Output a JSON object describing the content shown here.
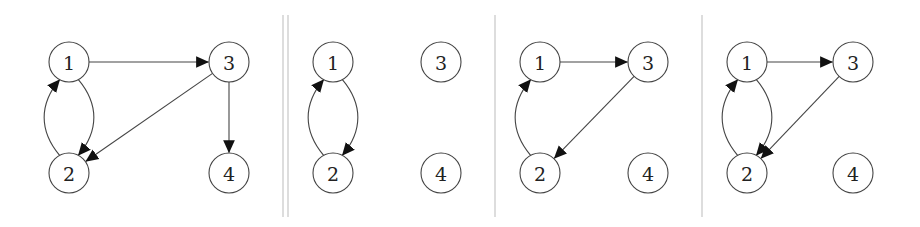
{
  "diagram": {
    "node_radius": 20,
    "colors": {
      "stroke": "#444444",
      "label": "#222222",
      "arrowhead": "#111111",
      "divider": "#bbbbbb"
    },
    "dividers": [
      {
        "type": "double",
        "x": [
          283,
          288
        ],
        "y1": 15,
        "y2": 217
      },
      {
        "type": "single",
        "x": [
          495
        ],
        "y1": 15,
        "y2": 217
      },
      {
        "type": "single",
        "x": [
          702
        ],
        "y1": 15,
        "y2": 217
      }
    ],
    "panels": [
      {
        "id": "panel-1",
        "nodes": [
          {
            "label": "1",
            "x": 69,
            "y": 62
          },
          {
            "label": "2",
            "x": 69,
            "y": 173
          },
          {
            "label": "3",
            "x": 229,
            "y": 62
          },
          {
            "label": "4",
            "x": 229,
            "y": 173
          }
        ],
        "edges": [
          {
            "from": "1",
            "to": "3",
            "shape": "straight"
          },
          {
            "from": "3",
            "to": "4",
            "shape": "straight"
          },
          {
            "from": "3",
            "to": "2",
            "shape": "straight"
          },
          {
            "from": "1",
            "to": "2",
            "shape": "curve-right"
          },
          {
            "from": "2",
            "to": "1",
            "shape": "curve-left"
          }
        ]
      },
      {
        "id": "panel-2",
        "nodes": [
          {
            "label": "1",
            "x": 333,
            "y": 62
          },
          {
            "label": "2",
            "x": 333,
            "y": 173
          },
          {
            "label": "3",
            "x": 441,
            "y": 62
          },
          {
            "label": "4",
            "x": 441,
            "y": 173
          }
        ],
        "edges": [
          {
            "from": "1",
            "to": "2",
            "shape": "curve-right"
          },
          {
            "from": "2",
            "to": "1",
            "shape": "curve-left"
          }
        ]
      },
      {
        "id": "panel-3",
        "nodes": [
          {
            "label": "1",
            "x": 540,
            "y": 62
          },
          {
            "label": "2",
            "x": 540,
            "y": 173
          },
          {
            "label": "3",
            "x": 648,
            "y": 62
          },
          {
            "label": "4",
            "x": 648,
            "y": 173
          }
        ],
        "edges": [
          {
            "from": "1",
            "to": "3",
            "shape": "straight"
          },
          {
            "from": "3",
            "to": "2",
            "shape": "straight"
          },
          {
            "from": "2",
            "to": "1",
            "shape": "curve-left"
          }
        ]
      },
      {
        "id": "panel-4",
        "nodes": [
          {
            "label": "1",
            "x": 747,
            "y": 62
          },
          {
            "label": "2",
            "x": 747,
            "y": 173
          },
          {
            "label": "3",
            "x": 853,
            "y": 62
          },
          {
            "label": "4",
            "x": 853,
            "y": 173
          }
        ],
        "edges": [
          {
            "from": "1",
            "to": "3",
            "shape": "straight"
          },
          {
            "from": "3",
            "to": "2",
            "shape": "straight"
          },
          {
            "from": "1",
            "to": "2",
            "shape": "curve-right"
          },
          {
            "from": "2",
            "to": "1",
            "shape": "curve-left"
          }
        ]
      }
    ]
  }
}
